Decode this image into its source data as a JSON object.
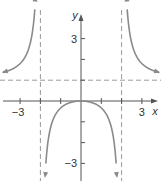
{
  "chart_data": {
    "type": "line",
    "title": "",
    "xlabel": "x",
    "ylabel": "y",
    "xlim": [
      -4,
      4
    ],
    "ylim": [
      -4,
      5
    ],
    "grid": false,
    "x_tick_labels": [
      {
        "value": -3,
        "label": "−3"
      },
      {
        "value": 3,
        "label": "3"
      }
    ],
    "y_tick_labels": [
      {
        "value": 3,
        "label": "3"
      },
      {
        "value": -3,
        "label": "−3"
      }
    ],
    "x_ticks": [
      -3,
      -2,
      -1,
      1,
      2,
      3
    ],
    "y_ticks": [
      -3,
      -2,
      -1,
      1,
      2,
      3
    ],
    "function": "y = x^2 / (x^2 - 4)",
    "asymptotes": {
      "vertical": [
        -2,
        2
      ],
      "horizontal": [
        1
      ]
    },
    "series": [
      {
        "name": "left branch",
        "x": [
          -3.9,
          -3.5,
          -3,
          -2.6,
          -2.35,
          -2.25
        ],
        "y": [
          1.36,
          1.49,
          1.8,
          2.45,
          3.9,
          4.76
        ]
      },
      {
        "name": "middle branch",
        "x": [
          -1.85,
          -1.5,
          -1,
          -0.5,
          0,
          0.5,
          1,
          1.5,
          1.85
        ],
        "y": [
          -5.9,
          -1.29,
          -0.33,
          -0.07,
          0,
          -0.07,
          -0.33,
          -1.29,
          -5.9
        ]
      },
      {
        "name": "right branch",
        "x": [
          2.25,
          2.35,
          2.6,
          3,
          3.5,
          3.9
        ],
        "y": [
          4.76,
          3.9,
          2.45,
          1.8,
          1.49,
          1.36
        ]
      }
    ],
    "colors": {
      "curve": "#8a8a8a",
      "axis": "#555555",
      "asymptote": "#9a9a9a"
    }
  },
  "axes": {
    "x_label": "x",
    "y_label": "y"
  }
}
